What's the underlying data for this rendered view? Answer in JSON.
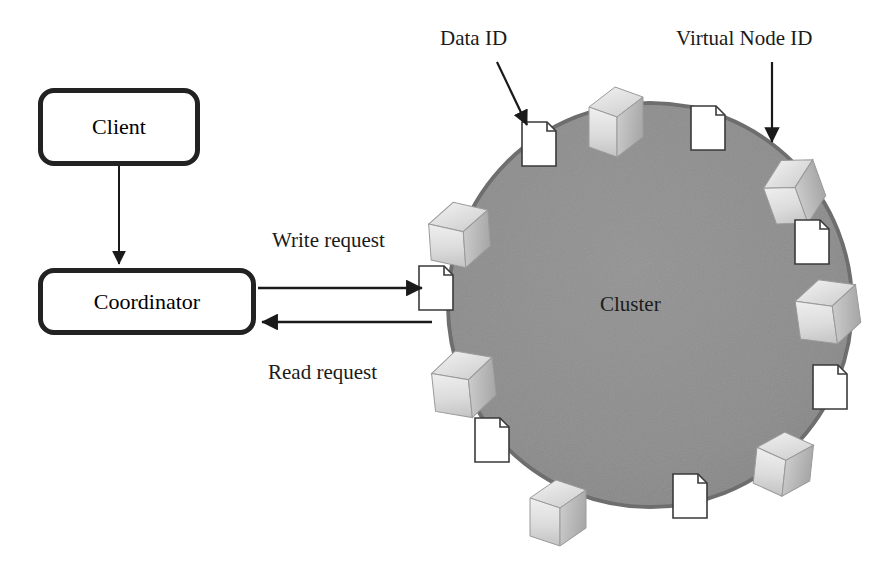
{
  "diagram": {
    "background_color": "#ffffff",
    "cluster_fill_color": "#8e8e8e",
    "cluster_stroke_color": "#6a6a6a",
    "line_color": "#1a1a1a",
    "node_color": "#bdbdbd",
    "doc_color": "#ffffff"
  },
  "boxes": [
    {
      "id": "client",
      "label": "Client",
      "x": 38,
      "y": 88,
      "width": 162,
      "height": 78
    },
    {
      "id": "coordinator",
      "label": "Coordinator",
      "x": 38,
      "y": 268,
      "width": 218,
      "height": 67
    }
  ],
  "annotations": [
    {
      "id": "data-id",
      "label": "Data ID",
      "x": 440,
      "y": 30,
      "arrow_from": [
        497,
        62
      ],
      "arrow_to": [
        531,
        129
      ]
    },
    {
      "id": "virtual-node-id",
      "label": "Virtual Node ID",
      "x": 676,
      "y": 30,
      "arrow_from": [
        772,
        62
      ],
      "arrow_to": [
        772,
        146
      ]
    }
  ],
  "edges": [
    {
      "id": "write-request",
      "label": "Write request",
      "from": "coordinator",
      "to": "cluster",
      "direction": "right",
      "label_x": 272,
      "label_y": 233,
      "line_y": 288,
      "line_x1": 258,
      "line_x2": 427
    },
    {
      "id": "read-request",
      "label": "Read request",
      "from": "cluster",
      "to": "coordinator",
      "direction": "left",
      "label_x": 268,
      "label_y": 366,
      "line_y": 322,
      "line_x1": 258,
      "line_x2": 430
    },
    {
      "id": "client-to-coordinator",
      "label": "",
      "from": "client",
      "to": "coordinator",
      "direction": "down",
      "line_x": 119,
      "line_y1": 166,
      "line_y2": 266
    }
  ],
  "cluster": {
    "label": "Cluster",
    "center_x": 650,
    "center_y": 305,
    "radius": 202,
    "label_x": 600,
    "label_y": 295
  },
  "virtual_nodes": [
    {
      "id": "vnode-1",
      "angle_deg": -72,
      "cx": 613,
      "cy": 113
    },
    {
      "id": "vnode-2",
      "angle_deg": -28,
      "cx": 790,
      "cy": 185
    },
    {
      "id": "vnode-3",
      "angle_deg": 8,
      "cx": 826,
      "cy": 305
    },
    {
      "id": "vnode-4",
      "angle_deg": 52,
      "cx": 782,
      "cy": 458
    },
    {
      "id": "vnode-5",
      "angle_deg": 104,
      "cx": 556,
      "cy": 506
    },
    {
      "id": "vnode-6",
      "angle_deg": 152,
      "cx": 466,
      "cy": 376
    },
    {
      "id": "vnode-7",
      "angle_deg": 190,
      "cx": 459,
      "cy": 228
    }
  ],
  "data_items": [
    {
      "id": "data-1",
      "cx": 539,
      "cy": 144
    },
    {
      "id": "data-2",
      "cx": 708,
      "cy": 128
    },
    {
      "id": "data-3",
      "cx": 812,
      "cy": 242
    },
    {
      "id": "data-4",
      "cx": 830,
      "cy": 387
    },
    {
      "id": "data-5",
      "cx": 690,
      "cy": 496
    },
    {
      "id": "data-6",
      "cx": 492,
      "cy": 440
    },
    {
      "id": "data-7",
      "cx": 436,
      "cy": 288
    }
  ],
  "icons": {
    "virtual_node": "server-box-icon",
    "data": "document-page-icon",
    "arrowhead": "arrow-head-icon"
  }
}
